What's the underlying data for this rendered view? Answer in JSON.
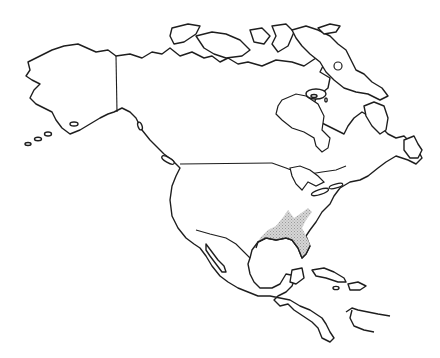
{
  "map": {
    "subject": "Outline map of North America",
    "style": "blank outline, no labels",
    "colors": {
      "background": "#ffffff",
      "outline": "#1e1e1e",
      "shaded_region": "#c9c9c9"
    },
    "regions": [
      {
        "name": "Alaska",
        "shaded": false
      },
      {
        "name": "Canada",
        "shaded": false
      },
      {
        "name": "Greenland (partial, not shown)",
        "shaded": false
      },
      {
        "name": "United States",
        "shaded": false
      },
      {
        "name": "Mexico",
        "shaded": false
      },
      {
        "name": "Central America",
        "shaded": false
      },
      {
        "name": "Caribbean islands",
        "shaded": false
      }
    ],
    "highlighted_area": {
      "description": "Stippled gray area in the south-central United States along the Gulf Coast (Texas to Florida panhandle, extending north toward the Ohio/Mississippi valley)",
      "pattern": "stipple"
    },
    "borders_drawn": [
      "Alaska–Canada",
      "Canada–US (49th parallel)"
    ]
  }
}
